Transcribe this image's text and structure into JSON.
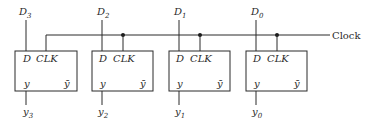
{
  "diagram": {
    "type": "parallel register of D flip-flops",
    "clock": {
      "label": "Clock"
    },
    "flipflops": [
      {
        "input": {
          "base": "D",
          "sub": "3"
        },
        "output": {
          "base": "y",
          "sub": "3"
        },
        "pins": {
          "d": "D",
          "clk": "CLK",
          "q": "y",
          "qbar": "ȳ"
        }
      },
      {
        "input": {
          "base": "D",
          "sub": "2"
        },
        "output": {
          "base": "y",
          "sub": "2"
        },
        "pins": {
          "d": "D",
          "clk": "CLK",
          "q": "y",
          "qbar": "ȳ"
        }
      },
      {
        "input": {
          "base": "D",
          "sub": "1"
        },
        "output": {
          "base": "y",
          "sub": "1"
        },
        "pins": {
          "d": "D",
          "clk": "CLK",
          "q": "y",
          "qbar": "ȳ"
        }
      },
      {
        "input": {
          "base": "D",
          "sub": "0"
        },
        "output": {
          "base": "y",
          "sub": "0"
        },
        "pins": {
          "d": "D",
          "clk": "CLK",
          "q": "y",
          "qbar": "ȳ"
        }
      }
    ]
  }
}
